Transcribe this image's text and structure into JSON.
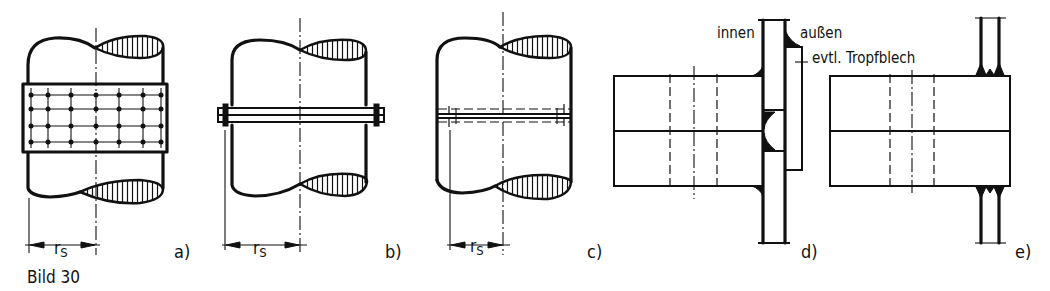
{
  "figure": {
    "caption": "Bild 30",
    "panels": [
      {
        "id": "a",
        "label": "a)",
        "dimension_label": "rS",
        "description": "pipe splice with bolted cover plate (grid of fasteners)"
      },
      {
        "id": "b",
        "label": "b)",
        "dimension_label": "rS",
        "description": "pipe splice with external flange ring"
      },
      {
        "id": "c",
        "label": "c)",
        "dimension_label": "rS",
        "description": "pipe splice with hidden internal flange (dashed)"
      },
      {
        "id": "d",
        "label": "d)",
        "annotations": {
          "inside": "innen",
          "outside": "außen",
          "drip_plate": "evtl. Tropfblech"
        }
      },
      {
        "id": "e",
        "label": "e)"
      }
    ]
  },
  "colors": {
    "ink": "#111111",
    "paper": "#ffffff"
  }
}
